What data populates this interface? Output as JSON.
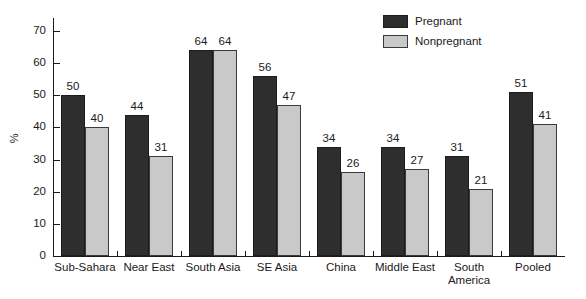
{
  "chart_data": {
    "type": "bar",
    "title": "",
    "xlabel": "",
    "ylabel": "%",
    "ylim": [
      0,
      70
    ],
    "yticks": [
      0,
      10,
      20,
      30,
      40,
      50,
      60,
      70
    ],
    "grid": false,
    "legend_position": "top-right",
    "categories": [
      "Sub-Sahara",
      "Near East",
      "South Asia",
      "SE Asia",
      "China",
      "Middle East",
      "South America",
      "Pooled"
    ],
    "series": [
      {
        "name": "Pregnant",
        "color": "#2e2e2e",
        "values": [
          50,
          44,
          64,
          56,
          34,
          34,
          31,
          51
        ]
      },
      {
        "name": "Nonpregnant",
        "color": "#c9c9c9",
        "values": [
          40,
          31,
          64,
          47,
          26,
          27,
          21,
          41
        ]
      }
    ]
  },
  "axis": {
    "y_title": "%",
    "y_tick_labels": [
      "70",
      "60",
      "50",
      "40",
      "30",
      "20",
      "10",
      "0"
    ]
  },
  "legend": {
    "items": [
      {
        "label": "Pregnant",
        "swatch": "pregnant"
      },
      {
        "label": "Nonpregnant",
        "swatch": "nonpregnant"
      }
    ]
  },
  "categories_display": [
    {
      "line1": "Sub-Sahara",
      "line2": ""
    },
    {
      "line1": "Near East",
      "line2": ""
    },
    {
      "line1": "South Asia",
      "line2": ""
    },
    {
      "line1": "SE Asia",
      "line2": ""
    },
    {
      "line1": "China",
      "line2": ""
    },
    {
      "line1": "Middle East",
      "line2": ""
    },
    {
      "line1": "South",
      "line2": "America"
    },
    {
      "line1": "Pooled",
      "line2": ""
    }
  ],
  "bar_labels": {
    "pregnant": [
      "50",
      "44",
      "64",
      "56",
      "34",
      "34",
      "31",
      "51"
    ],
    "nonpregnant": [
      "40",
      "31",
      "64",
      "47",
      "26",
      "27",
      "21",
      "41"
    ]
  }
}
